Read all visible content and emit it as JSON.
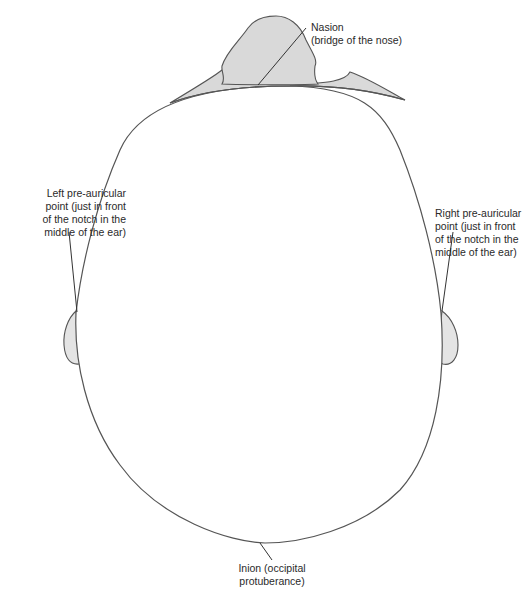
{
  "diagram": {
    "colors": {
      "outline": "#555555",
      "fill_shaded": "#d9d9d9",
      "text": "#2a2a2a",
      "background": "#ffffff"
    },
    "labels": {
      "nasion": {
        "line1": "Nasion",
        "line2": "(bridge of the nose)"
      },
      "left_preauricular": {
        "line1": "Left pre-auricular",
        "line2": "point (just in front",
        "line3": "of the notch in the",
        "line4": "middle of the ear)"
      },
      "right_preauricular": {
        "line1": "Right pre-auricular",
        "line2": "point (just in front",
        "line3": "of the notch in the",
        "line4": "middle of the ear)"
      },
      "inion": {
        "line1": "Inion (occipital",
        "line2": "protuberance)"
      }
    }
  }
}
